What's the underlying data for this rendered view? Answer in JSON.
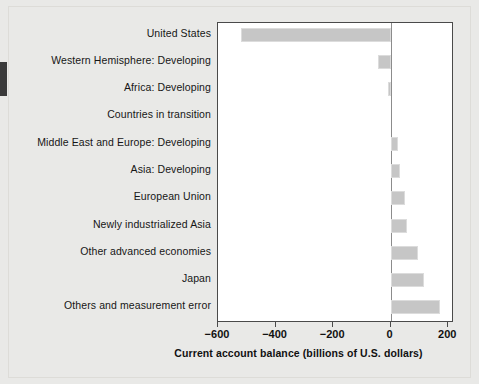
{
  "chart_data": {
    "type": "bar",
    "orientation": "horizontal",
    "title": "",
    "subtitle": "",
    "xlabel": "Current account balance (billions of U.S. dollars)",
    "ylabel": "",
    "xlim": [
      -600,
      220
    ],
    "xticks": [
      -600,
      -400,
      -200,
      0,
      200
    ],
    "xticklabels": [
      "−600",
      "−400",
      "−200",
      "0",
      "200"
    ],
    "grid": false,
    "legend": false,
    "legend_position": "none",
    "bar_color": "#c6c6c6",
    "bar_edge_color": "#dcdcdc",
    "zero_line_color": "#8c8c8c",
    "plot_background": "#ffffff",
    "page_background": "#e9e9e7",
    "categories": [
      "United States",
      "Western Hemisphere: Developing",
      "Africa: Developing",
      "Countries in transition",
      "Middle East and Europe: Developing",
      "Asia: Developing",
      "European Union",
      "Newly industrialized Asia",
      "Other advanced economies",
      "Japan",
      "Others and measurement error"
    ],
    "values": [
      -520,
      -45,
      -8,
      0,
      25,
      32,
      50,
      57,
      95,
      115,
      170
    ],
    "series": [
      {
        "name": "Current account balance",
        "values": [
          -520,
          -45,
          -8,
          0,
          25,
          32,
          50,
          57,
          95,
          115,
          170
        ]
      }
    ]
  },
  "axis": {
    "x_title": "Current account balance (billions of U.S. dollars)"
  }
}
